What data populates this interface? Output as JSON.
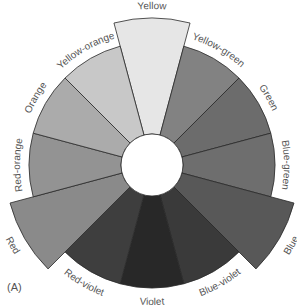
{
  "diagram": {
    "panel_label": "(A)",
    "center": {
      "x": 152,
      "y": 165
    },
    "inner_radius": 31,
    "outer_radius": 123,
    "primary_radius": 147,
    "label_radius": 132,
    "segments": [
      {
        "name": "Yellow",
        "angle": 0,
        "fill": "#e6e6e6",
        "primary": true
      },
      {
        "name": "Yellow-green",
        "angle": 30,
        "fill": "#828282",
        "primary": false
      },
      {
        "name": "Green",
        "angle": 60,
        "fill": "#6c6c6c",
        "primary": false
      },
      {
        "name": "Blue-green",
        "angle": 90,
        "fill": "#6e6e6e",
        "primary": false
      },
      {
        "name": "Blue",
        "angle": 120,
        "fill": "#585858",
        "primary": true
      },
      {
        "name": "Blue-violet",
        "angle": 150,
        "fill": "#3a3a3a",
        "primary": false
      },
      {
        "name": "Violet",
        "angle": 180,
        "fill": "#282828",
        "primary": false
      },
      {
        "name": "Red-violet",
        "angle": 210,
        "fill": "#3e3e3e",
        "primary": false
      },
      {
        "name": "Red",
        "angle": 240,
        "fill": "#8a8a8a",
        "primary": true
      },
      {
        "name": "Red-orange",
        "angle": 270,
        "fill": "#939393",
        "primary": false
      },
      {
        "name": "Orange",
        "angle": 300,
        "fill": "#ababab",
        "primary": false
      },
      {
        "name": "Yellow-orange",
        "angle": 330,
        "fill": "#c8c8c8",
        "primary": false
      }
    ]
  }
}
